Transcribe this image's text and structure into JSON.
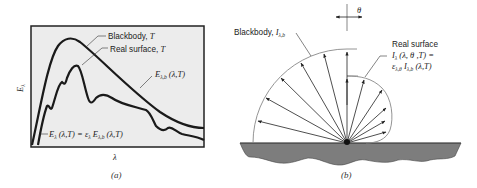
{
  "figure_a": {
    "caption": "(a)",
    "axis_y_label": "E",
    "axis_y_sub": "λ",
    "axis_x_label": "λ",
    "labels": {
      "blackbody": "Blackbody, ",
      "blackbody_T": "T",
      "real_surface": "Real surface, ",
      "real_surface_T": "T",
      "eb_main": "E",
      "eb_sub": "λ,b",
      "eb_args": " (λ,T)",
      "eq_E": "E",
      "eq_E_sub": "λ",
      "eq_mid": " (λ,T) = ε",
      "eq_eps_sub": "λ",
      "eq_E2": " E",
      "eq_E2_sub": "λ,b",
      "eq_end": " (λ,T)"
    },
    "colors": {
      "plot_bg": "#ececec",
      "curve": "#1a1a1a",
      "frame": "#222222"
    }
  },
  "figure_b": {
    "caption": "(b)",
    "theta_label": "θ",
    "labels": {
      "blackbody": "Blackbody, ",
      "blackbody_I": "I",
      "blackbody_sub": "λ,b",
      "real_surface": "Real surface",
      "line2_I": "I",
      "line2_I_sub": "λ",
      "line2_args": " (λ, θ ,T) =",
      "line3_eps": "ε",
      "line3_eps_sub": "λ,θ",
      "line3_I": " I",
      "line3_I_sub": "λ,b",
      "line3_args": " (λ,T)"
    },
    "colors": {
      "ground": "#7d7d7d",
      "ray": "#222222",
      "arc": "#888888"
    }
  }
}
